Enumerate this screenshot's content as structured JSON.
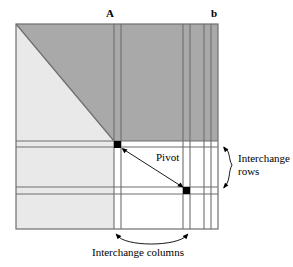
{
  "figure": {
    "title_labels": {
      "matrix_label": "A",
      "vector_label": "b"
    },
    "annotations": {
      "pivot": "Pivot",
      "interchange_rows_line1": "Interchange",
      "interchange_rows_line2": "rows",
      "interchange_columns": "Interchange columns"
    },
    "colors": {
      "upper_triangle_fill": "#a9a9a9",
      "lower_left_fill": "#e9e9e9",
      "active_submatrix_fill": "#ffffff",
      "line_stroke": "#6e6e6e",
      "pivot_marker_fill": "#000000",
      "text_color": "#000000",
      "background": "#ffffff"
    },
    "geometry": {
      "frame": {
        "x": 16,
        "y": 24,
        "width": 202,
        "height": 205
      },
      "split_x": 114,
      "split_y": 141,
      "pivot_marker_1": {
        "x": 114,
        "y": 141,
        "size": 7
      },
      "pivot_marker_2": {
        "x": 183,
        "y": 187,
        "size": 7
      },
      "vertical_lines": [
        114,
        121,
        183,
        190,
        204,
        211
      ],
      "horizontal_lines": [
        141,
        147,
        187,
        194
      ],
      "diagonal": {
        "x1": 16,
        "y1": 24,
        "x2": 114,
        "y2": 141
      }
    }
  }
}
